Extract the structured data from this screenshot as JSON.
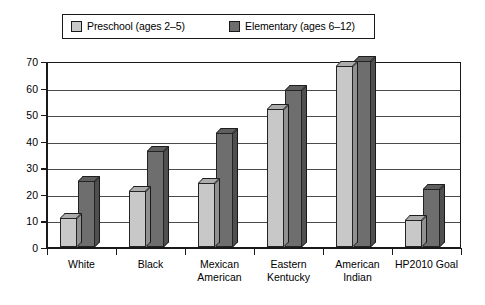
{
  "legend": {
    "entries": [
      {
        "label": "Preschool (ages 2–5)",
        "color": "#c8c8c8",
        "swatch_icon": "legend-swatch-preschool"
      },
      {
        "label": "Elementary (ages 6–12)",
        "color": "#6e6e6e",
        "swatch_icon": "legend-swatch-elementary"
      }
    ]
  },
  "chart_data": {
    "type": "bar",
    "title": "",
    "subtitle": "",
    "xlabel": "",
    "ylabel": "",
    "ylim": [
      0,
      70
    ],
    "yticks": [
      0,
      10,
      20,
      30,
      40,
      50,
      60,
      70
    ],
    "ytick_labels": [
      "0",
      "10",
      "20",
      "30",
      "40",
      "50",
      "60",
      "70"
    ],
    "grid": true,
    "legend_position": "top",
    "categories": [
      "White",
      "Black",
      "Mexican\nAmerican",
      "Eastern\nKentucky",
      "American\nIndian",
      "HP2010 Goal"
    ],
    "series": [
      {
        "name": "Preschool (ages 2–5)",
        "color": "#c8c8c8",
        "values": [
          11,
          21,
          24,
          52,
          68,
          10
        ]
      },
      {
        "name": "Elementary (ages 6–12)",
        "color": "#6e6e6e",
        "values": [
          25,
          36,
          43,
          59,
          70,
          22
        ]
      }
    ]
  }
}
